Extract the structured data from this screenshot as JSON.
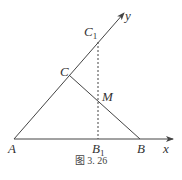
{
  "figure": {
    "caption": "图 3. 26",
    "colors": {
      "line": "#444444",
      "text": "#333333",
      "background": "#ffffff"
    }
  },
  "axes": {
    "x": {
      "label": "x"
    },
    "y": {
      "label": "y"
    }
  },
  "points": {
    "A": {
      "label": "A"
    },
    "B": {
      "label": "B"
    },
    "C": {
      "label": "C"
    },
    "M": {
      "label": "M"
    },
    "C1": {
      "label": "C",
      "sub": "1"
    },
    "B1": {
      "label": "B",
      "sub": "1"
    }
  }
}
